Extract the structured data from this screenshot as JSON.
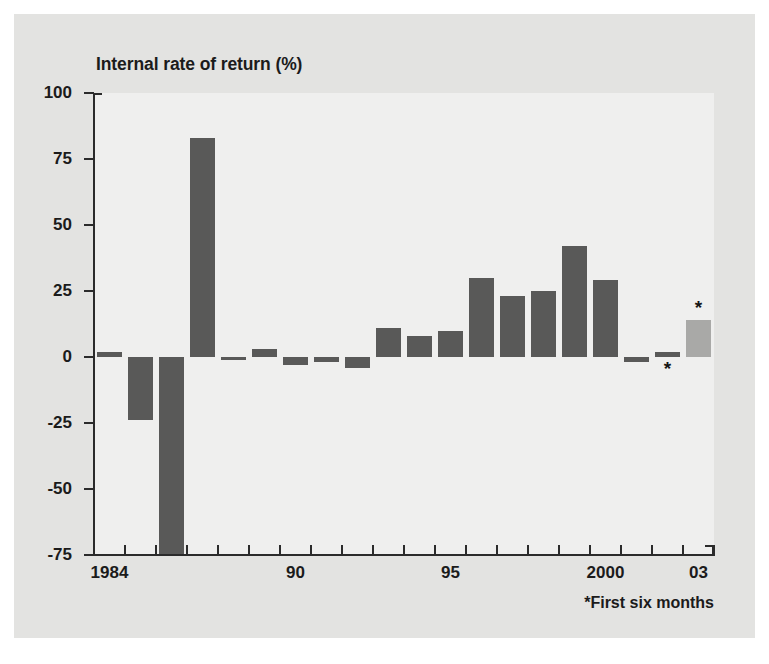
{
  "chart_data": {
    "type": "bar",
    "title": "Internal rate of return (%)",
    "xlabel": "",
    "ylabel": "Internal rate of return (%)",
    "ylim": [
      -75,
      100
    ],
    "yticks": [
      100,
      75,
      50,
      25,
      0,
      -25,
      -50,
      -75
    ],
    "ytick_labels": [
      "100",
      "75",
      "50",
      "25",
      "0",
      "-25",
      "-50",
      "-75"
    ],
    "xtick_labels": [
      "1984",
      "90",
      "95",
      "2000",
      "03"
    ],
    "grid": false,
    "legend": false,
    "annotation": "*First six months",
    "categories": [
      "1984",
      "1985",
      "1986",
      "1987",
      "1988",
      "1989",
      "1990",
      "1991",
      "1992",
      "1993",
      "1994",
      "1995",
      "1996",
      "1997",
      "1998",
      "1999",
      "2000",
      "2001",
      "2002",
      "2003"
    ],
    "values": [
      2,
      -24,
      -82,
      83,
      -1,
      3,
      -3,
      -2,
      -4,
      11,
      8,
      10,
      30,
      23,
      25,
      42,
      29,
      -2,
      2,
      14
    ],
    "series": [
      {
        "name": "Internal rate of return",
        "values": [
          2,
          -24,
          -82,
          83,
          -1,
          3,
          -3,
          -2,
          -4,
          11,
          8,
          10,
          30,
          23,
          25,
          42,
          29,
          -2,
          2,
          14
        ]
      }
    ],
    "starred_categories": [
      "2002",
      "2003"
    ],
    "clipped_categories": [
      "1986"
    ],
    "colors": {
      "bar": "#595958",
      "bar_forecast": "#a9a9a7",
      "plot_background": "#efefee",
      "figure_background": "#e3e3e1",
      "axis": "#2b2b2b",
      "text": "#1b1b1b"
    }
  },
  "footnote": {
    "text": "*First six months"
  }
}
